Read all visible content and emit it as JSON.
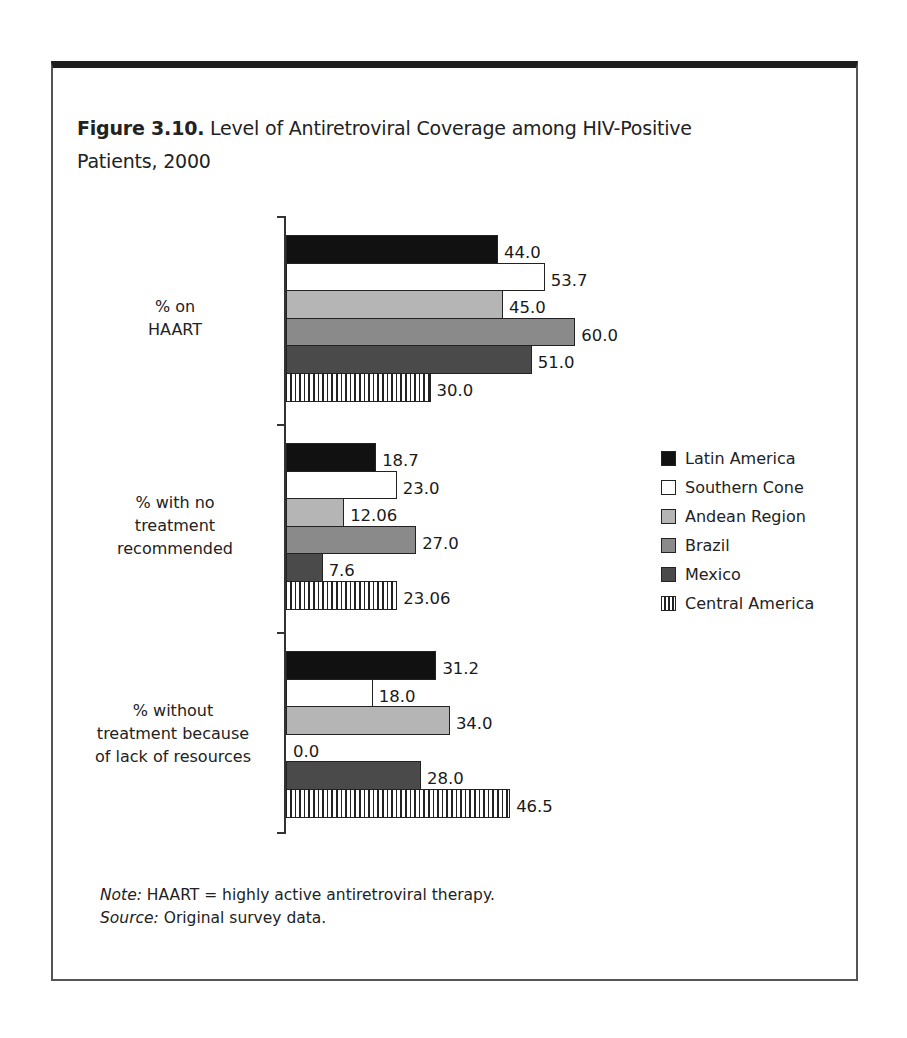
{
  "figure": {
    "title_bold": "Figure 3.10.",
    "title_rest": " Level of Antiretroviral Coverage among HIV-Positive",
    "title_line2": "Patients, 2000"
  },
  "note": {
    "note_label": "Note:",
    "note_text": " HAART = highly active antiretroviral therapy.",
    "source_label": "Source:",
    "source_text": " Original survey data."
  },
  "legend": [
    {
      "label": "Latin America",
      "color": "#111111",
      "pattern": "solid"
    },
    {
      "label": "Southern Cone",
      "color": "#ffffff",
      "pattern": "solid"
    },
    {
      "label": "Andean Region",
      "color": "#b5b5b5",
      "pattern": "solid"
    },
    {
      "label": "Brazil",
      "color": "#8a8a8a",
      "pattern": "solid"
    },
    {
      "label": "Mexico",
      "color": "#4a4a4a",
      "pattern": "solid"
    },
    {
      "label": "Central America",
      "color": "#ffffff",
      "pattern": "vertical-stripes"
    }
  ],
  "chart_data": {
    "type": "bar",
    "orientation": "horizontal",
    "title": "Figure 3.10. Level of Antiretroviral Coverage among HIV-Positive Patients, 2000",
    "xlabel": "",
    "ylabel": "",
    "categories": [
      "% on HAART",
      "% with no treatment recommended",
      "% without treatment because of lack of resources"
    ],
    "category_lines": [
      [
        "% on",
        "HAART"
      ],
      [
        "% with no",
        "treatment",
        "recommended"
      ],
      [
        "% without",
        "treatment because",
        "of lack of resources"
      ]
    ],
    "series": [
      {
        "name": "Latin America",
        "values": [
          44.0,
          18.7,
          31.2
        ],
        "labels": [
          "44.0",
          "18.7",
          "31.2"
        ]
      },
      {
        "name": "Southern Cone",
        "values": [
          53.7,
          23.0,
          18.0
        ],
        "labels": [
          "53.7",
          "23.0",
          "18.0"
        ]
      },
      {
        "name": "Andean Region",
        "values": [
          45.0,
          12.06,
          34.0
        ],
        "labels": [
          "45.0",
          "12.06",
          "34.0"
        ]
      },
      {
        "name": "Brazil",
        "values": [
          60.0,
          27.0,
          0.0
        ],
        "labels": [
          "60.0",
          "27.0",
          "0.0"
        ]
      },
      {
        "name": "Mexico",
        "values": [
          51.0,
          7.6,
          28.0
        ],
        "labels": [
          "51.0",
          "7.6",
          "28.0"
        ]
      },
      {
        "name": "Central America",
        "values": [
          30.0,
          23.06,
          46.5
        ],
        "labels": [
          "30.0",
          "23.06",
          "46.5"
        ]
      }
    ],
    "xlim": [
      0,
      65
    ],
    "grid": false,
    "legend_position": "right",
    "data_labels": true
  }
}
